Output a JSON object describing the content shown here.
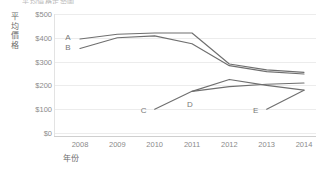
{
  "chart_data": {
    "type": "line",
    "title": "平均價格走勢圖",
    "xlabel": "年份",
    "ylabel": "平均價格",
    "x": [
      2008,
      2009,
      2010,
      2011,
      2012,
      2013,
      2014
    ],
    "categories": [
      "2008",
      "2009",
      "2010",
      "2011",
      "2012",
      "2013",
      "2014"
    ],
    "xtick_labels": [
      "2008",
      "2009",
      "2010",
      "2011",
      "2012",
      "2013",
      "2014"
    ],
    "ytick_labels": [
      "$500",
      "$400",
      "$300",
      "$200",
      "$100",
      "$0"
    ],
    "yticks": [
      500,
      400,
      300,
      200,
      100,
      0
    ],
    "ylim": [
      0,
      500
    ],
    "xlim": [
      2008,
      2014
    ],
    "grid": true,
    "legend": "inline-labels",
    "legend_position": "none",
    "line_color": "#6f6f6f",
    "grid_color": "#ececec",
    "axis_color": "#cfcfcf",
    "tick_text_color": "#8a8a8a",
    "series": [
      {
        "name": "A",
        "label": "A",
        "x": [
          2008,
          2009,
          2010,
          2011,
          2012,
          2013,
          2014
        ],
        "values": [
          395,
          415,
          420,
          420,
          290,
          265,
          255
        ]
      },
      {
        "name": "B",
        "label": "B",
        "x": [
          2008,
          2009,
          2010,
          2011,
          2012,
          2013,
          2014
        ],
        "values": [
          355,
          400,
          408,
          375,
          283,
          258,
          248
        ]
      },
      {
        "name": "C",
        "label": "C",
        "x": [
          2010,
          2011,
          2012,
          2013,
          2014
        ],
        "values": [
          100,
          175,
          225,
          200,
          180
        ]
      },
      {
        "name": "D",
        "label": "D",
        "x": [
          2011,
          2012,
          2013,
          2014
        ],
        "values": [
          175,
          195,
          205,
          210
        ]
      },
      {
        "name": "E",
        "label": "E",
        "x": [
          2013,
          2014
        ],
        "values": [
          100,
          180
        ]
      }
    ],
    "series_label_anchors": [
      {
        "name": "A",
        "x": 2008,
        "y": 395,
        "dx": -12,
        "dy": -2
      },
      {
        "name": "B",
        "x": 2008,
        "y": 355,
        "dx": -12,
        "dy": -2
      },
      {
        "name": "C",
        "x": 2010,
        "y": 100,
        "dx": -11,
        "dy": 1
      },
      {
        "name": "D",
        "x": 2011,
        "y": 175,
        "dx": -2,
        "dy": 13
      },
      {
        "name": "E",
        "x": 2013,
        "y": 100,
        "dx": -11,
        "dy": 1
      }
    ]
  }
}
